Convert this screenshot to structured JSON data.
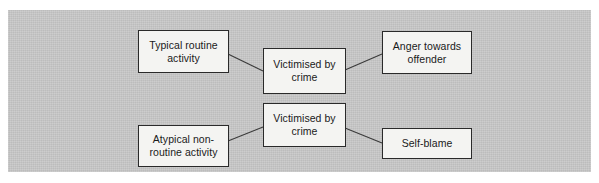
{
  "figure": {
    "type": "flow-diagram",
    "panel_color": "#c9c9c9",
    "box_fill": "#f4f4f2",
    "box_border_color": "#2a2a2a",
    "line_color": "#3a3a3a",
    "nodes": [
      {
        "id": "typical-routine-activity",
        "label": "Typical routine\nactivity"
      },
      {
        "id": "victimised-by-crime-top",
        "label": "Victimised by\ncrime"
      },
      {
        "id": "anger-towards-offender",
        "label": "Anger towards\noffender"
      },
      {
        "id": "atypical-non-routine-activity",
        "label": "Atypical non-\nroutine activity"
      },
      {
        "id": "victimised-by-crime-bottom",
        "label": "Victimised by\ncrime"
      },
      {
        "id": "self-blame",
        "label": "Self-blame"
      }
    ],
    "connections": [
      {
        "from": "typical-routine-activity",
        "to": "victimised-by-crime-top"
      },
      {
        "from": "victimised-by-crime-top",
        "to": "anger-towards-offender"
      },
      {
        "from": "atypical-non-routine-activity",
        "to": "victimised-by-crime-bottom"
      },
      {
        "from": "victimised-by-crime-bottom",
        "to": "self-blame"
      }
    ]
  }
}
